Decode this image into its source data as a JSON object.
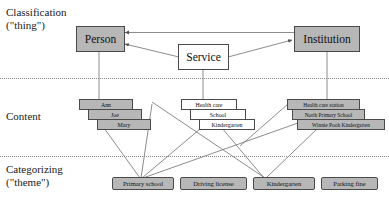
{
  "diagram": {
    "rows": [
      {
        "id": "classification",
        "line1": "Classification",
        "line2": "(\"thing\")"
      },
      {
        "id": "content",
        "line1": "Content",
        "line2": ""
      },
      {
        "id": "categorizing",
        "line1": "Categorizing",
        "line2": "(\"theme\")"
      }
    ],
    "classification_nodes": [
      {
        "id": "person",
        "label": "Person",
        "fill": "#b7b7b7"
      },
      {
        "id": "service",
        "label": "Service",
        "fill": "#ffffff"
      },
      {
        "id": "institution",
        "label": "Institution",
        "fill": "#b7b7b7"
      }
    ],
    "content_nodes": {
      "person_group": [
        {
          "id": "ann",
          "label": "Ann",
          "fill": "#b7b7b7"
        },
        {
          "id": "joe",
          "label": "Joe",
          "fill": "#b7b7b7"
        },
        {
          "id": "mary",
          "label": "Mary",
          "fill": "#b7b7b7"
        }
      ],
      "service_group": [
        {
          "id": "health-care",
          "label": "Health care",
          "fill": "#ffffff"
        },
        {
          "id": "school",
          "label": "School",
          "fill": "#ffffff"
        },
        {
          "id": "kindergarten",
          "label": "Kindergarten",
          "fill": "#ffffff"
        }
      ],
      "institution_group": [
        {
          "id": "health-care-station",
          "label": "Health care station",
          "fill": "#b7b7b7"
        },
        {
          "id": "north-primary-school",
          "label": "North Primary School",
          "fill": "#b7b7b7"
        },
        {
          "id": "winnie-pooh-kindergarten",
          "label": "Winnie Pooh Kindergarten",
          "fill": "#b7b7b7"
        }
      ]
    },
    "categorizing_nodes": [
      {
        "id": "primary-school",
        "label": "Primary school",
        "fill": "#b7b7b7"
      },
      {
        "id": "driving-license",
        "label": "Driving license",
        "fill": "#b7b7b7"
      },
      {
        "id": "kindergarten-theme",
        "label": "Kindergarten",
        "fill": "#b7b7b7"
      },
      {
        "id": "parking-fine",
        "label": "Parking fine",
        "fill": "#b7b7b7"
      }
    ],
    "edges": [
      {
        "from": "institution",
        "to": "person",
        "arrow": true
      },
      {
        "from": "service",
        "to": "person",
        "arrow": true
      },
      {
        "from": "service",
        "to": "institution",
        "arrow": true
      },
      {
        "from": "person",
        "to": "person-content-group",
        "arrow": false
      },
      {
        "from": "service",
        "to": "service-content-group",
        "arrow": false
      },
      {
        "from": "institution",
        "to": "institution-content-group",
        "arrow": false
      },
      {
        "from": "mary",
        "to": "primary-school",
        "arrow": false
      },
      {
        "from": "mary",
        "to": "kindergarten-theme",
        "arrow": false
      },
      {
        "from": "ann",
        "to": "kindergarten-theme",
        "arrow": false
      },
      {
        "from": "school",
        "to": "primary-school",
        "arrow": false
      },
      {
        "from": "kindergarten",
        "to": "kindergarten-theme",
        "arrow": false
      },
      {
        "from": "north-primary-school",
        "to": "primary-school",
        "arrow": false
      },
      {
        "from": "winnie-pooh-kindergarten",
        "to": "kindergarten-theme",
        "arrow": false
      }
    ],
    "colors": {
      "node_grey": "#b7b7b7",
      "node_white": "#ffffff",
      "node_border": "#4a4a4a",
      "edge": "#6e6e6e",
      "band_divider": "#8a8a8a",
      "text": "#111111"
    }
  }
}
